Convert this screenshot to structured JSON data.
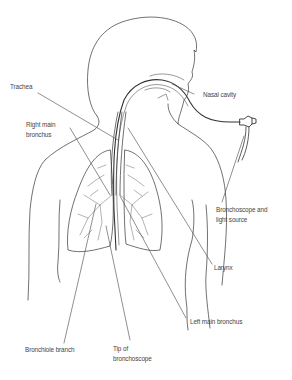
{
  "diagram": {
    "labels": {
      "trachea": "Trachea",
      "right_main_bronchus": "Right main\nbronchus",
      "nasal_cavity": "Nasal cavity",
      "bronchoscope_light": "Bronchoscope and\nlight source",
      "larynx": "Larynx",
      "left_main_bronchus": "Left main bronchus",
      "bronchiole_branch": "Bronchiole branch",
      "tip_of_bronchoscope": "Tip of\nbronchoscope"
    },
    "colors": {
      "line": "#333333",
      "text": "#444444",
      "background": "#ffffff"
    }
  }
}
